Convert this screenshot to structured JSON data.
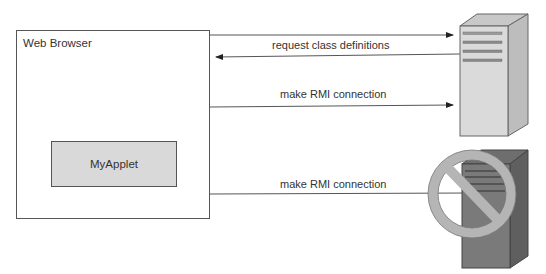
{
  "diagram": {
    "browser": {
      "label": "Web Browser"
    },
    "applet": {
      "label": "MyApplet"
    },
    "arrows": [
      {
        "label": "",
        "direction": "to-server",
        "target": "server-allowed"
      },
      {
        "label": "request class definitions",
        "direction": "to-browser",
        "target": "server-allowed"
      },
      {
        "label": "make RMI connection",
        "direction": "to-server",
        "target": "server-allowed"
      },
      {
        "label": "make RMI connection",
        "direction": "to-server",
        "target": "server-blocked",
        "blocked": true
      }
    ],
    "servers": [
      {
        "name": "allowed-server",
        "icon": "server-icon",
        "color": "#d6d6d6"
      },
      {
        "name": "blocked-server",
        "icon": "server-icon",
        "color": "#7a7a7a",
        "overlay": "prohibited-icon"
      }
    ],
    "colors": {
      "line": "#555555",
      "applet_fill": "#d9d9d9",
      "server_light": "#d6d6d6",
      "server_dark": "#7a7a7a",
      "prohibit": "#b8b8b8"
    }
  }
}
